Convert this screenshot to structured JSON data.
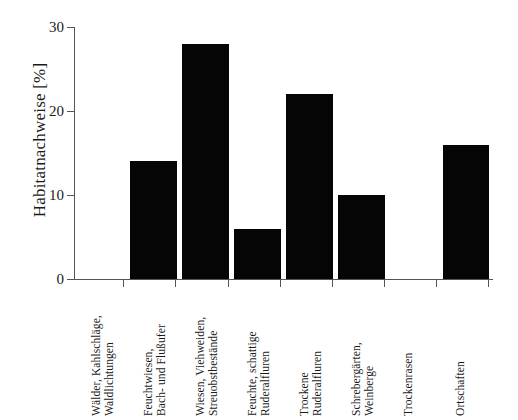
{
  "chart_data": {
    "type": "bar",
    "title": "",
    "xlabel": "",
    "ylabel": "Habitatnachweise [%]",
    "ylim": [
      0,
      30
    ],
    "yticks": [
      "0",
      "10",
      "20",
      "30"
    ],
    "ytick_values": [
      0,
      10,
      20,
      30
    ],
    "grid": false,
    "legend": "none",
    "bar_color": "#050505",
    "axis_color": "#555555",
    "categories": [
      "Wälder, Kahlschläge, Waldlichtungen",
      "Feuchtwiesen, Bach- und Flußufer",
      "Wiesen, Viehweiden, Streuobstbestände",
      "Feuchte, schattige Ruderalfluren",
      "Trockene Ruderalfluren",
      "Schrebergärten, Weinberge",
      "Trockenrasen",
      "Ortschaften"
    ],
    "category_lines": [
      [
        "Wälder, Kahlschläge,",
        "Waldlichtungen"
      ],
      [
        "Feuchtwiesen,",
        "Bach- und Flußufer"
      ],
      [
        "Wiesen, Viehweiden,",
        "Streuobstbestände"
      ],
      [
        "Feuchte, schattige",
        "Ruderalfluren"
      ],
      [
        "Trockene",
        "Ruderalfluren"
      ],
      [
        "Schrebergärten,",
        "Weinberge"
      ],
      [
        "Trockenrasen",
        ""
      ],
      [
        "Ortschaften",
        ""
      ]
    ],
    "values": [
      0,
      14,
      28,
      6,
      22,
      10,
      0,
      16
    ]
  }
}
